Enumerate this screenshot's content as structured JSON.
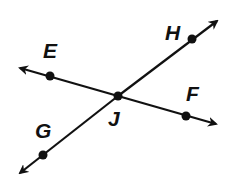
{
  "diagram": {
    "type": "intersecting-lines",
    "intersection_point": "J",
    "lines": [
      {
        "name": "line-EF",
        "points": [
          "E",
          "J",
          "F"
        ]
      },
      {
        "name": "line-GH",
        "points": [
          "G",
          "J",
          "H"
        ]
      }
    ],
    "labels": {
      "E": "E",
      "F": "F",
      "G": "G",
      "H": "H",
      "J": "J"
    },
    "colors": {
      "stroke": "#111111",
      "background": "#ffffff"
    }
  }
}
